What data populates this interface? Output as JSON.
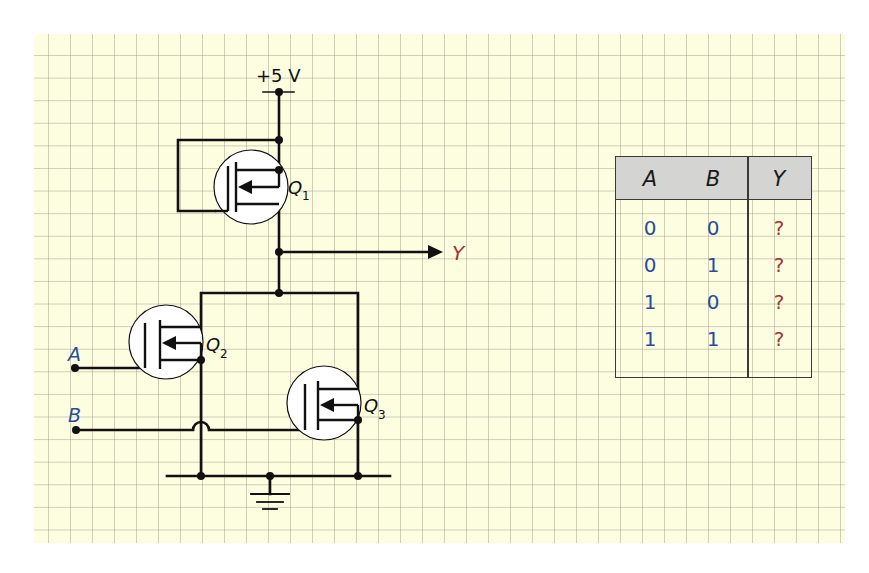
{
  "circuit": {
    "supply_label": "+5 V",
    "output_label": "Y",
    "inputs": [
      {
        "label": "A"
      },
      {
        "label": "B"
      }
    ],
    "transistors": [
      {
        "name": "Q",
        "subscript": "1"
      },
      {
        "name": "Q",
        "subscript": "2"
      },
      {
        "name": "Q",
        "subscript": "3"
      }
    ]
  },
  "truth_table": {
    "headers": [
      "A",
      "B",
      "Y"
    ],
    "rows": [
      [
        "0",
        "0",
        "?"
      ],
      [
        "0",
        "1",
        "?"
      ],
      [
        "1",
        "0",
        "?"
      ],
      [
        "1",
        "1",
        "?"
      ]
    ]
  },
  "colors": {
    "paper": "#fdfde0",
    "wire": "#111111",
    "input_label": "#2a4d9a",
    "output_label": "#a83232",
    "table_header": "#d4d4d2"
  }
}
